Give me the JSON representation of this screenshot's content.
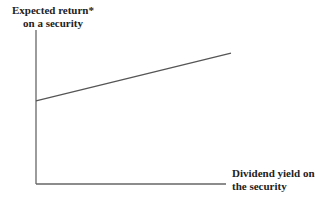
{
  "chart_data": {
    "type": "line",
    "title": "",
    "ylabel_line1": "Expected return*",
    "ylabel_line2": "on a security",
    "xlabel_line1": "Dividend yield on",
    "xlabel_line2": "the security",
    "grid": false,
    "ticks": "none",
    "series": [
      {
        "name": "Expected return vs dividend yield",
        "x": [
          0,
          1
        ],
        "y": [
          0.54,
          0.85
        ],
        "color": "#555555"
      }
    ],
    "xlim": [
      0,
      1
    ],
    "ylim": [
      0,
      1
    ],
    "annotations": []
  },
  "colors": {
    "axis": "#555555",
    "line": "#555555",
    "text": "#222222"
  }
}
